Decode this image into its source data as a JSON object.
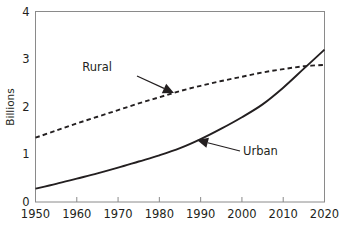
{
  "chart_data": {
    "type": "line",
    "title": "",
    "xlabel": "",
    "ylabel": "Billions",
    "xlim": [
      1950,
      2020
    ],
    "ylim": [
      0,
      4
    ],
    "grid": false,
    "legend_position": "inline-annotations",
    "x_ticks": [
      "1950",
      "1960",
      "1970",
      "1980",
      "1990",
      "2000",
      "2010",
      "2020"
    ],
    "y_ticks": [
      "0",
      "1",
      "2",
      "3",
      "4"
    ],
    "x": [
      1950,
      1955,
      1960,
      1965,
      1970,
      1975,
      1980,
      1985,
      1990,
      1995,
      2000,
      2005,
      2010,
      2015,
      2020
    ],
    "series": [
      {
        "name": "Rural",
        "style": "dashed",
        "color": "#231f20",
        "values": [
          1.35,
          1.5,
          1.65,
          1.79,
          1.93,
          2.07,
          2.2,
          2.33,
          2.44,
          2.54,
          2.63,
          2.72,
          2.79,
          2.85,
          2.88
        ]
      },
      {
        "name": "Urban",
        "style": "solid",
        "color": "#231f20",
        "values": [
          0.28,
          0.38,
          0.49,
          0.6,
          0.72,
          0.85,
          0.98,
          1.13,
          1.32,
          1.54,
          1.78,
          2.05,
          2.4,
          2.8,
          3.2
        ]
      }
    ],
    "annotations": [
      {
        "label": "Rural",
        "text_x": 112,
        "text_y": 71,
        "leader_from_x": 137,
        "leader_from_y": 76,
        "arrow_tip_x": 174,
        "arrow_tip_y": 93
      },
      {
        "label": "Urban",
        "text_x": 243,
        "text_y": 155,
        "leader_from_x": 240,
        "leader_from_y": 151,
        "arrow_tip_x": 197,
        "arrow_tip_y": 140
      }
    ]
  },
  "axis": {
    "y_title": "Billions"
  }
}
